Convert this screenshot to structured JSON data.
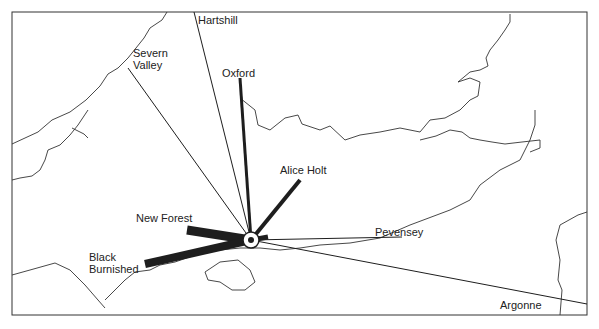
{
  "map": {
    "title": "Pottery sources supplying the site",
    "hub": {
      "x": 251,
      "y": 240,
      "label": "site"
    },
    "sources": [
      {
        "name": "Hartshill",
        "label_x": 198,
        "label_y": 14,
        "end_x": 194,
        "end_y": 12,
        "weight": 1
      },
      {
        "name": "Severn Valley",
        "label_x": 133,
        "label_y": 47,
        "end_x": 128,
        "end_y": 68,
        "weight": 1
      },
      {
        "name": "Oxford",
        "label_x": 222,
        "label_y": 67,
        "end_x": 240,
        "end_y": 78,
        "weight": 3
      },
      {
        "name": "Alice Holt",
        "label_x": 280,
        "label_y": 164,
        "end_x": 300,
        "end_y": 180,
        "weight": 4
      },
      {
        "name": "New Forest",
        "label_x": 136,
        "label_y": 212,
        "end_x": 187,
        "end_y": 230,
        "weight": 9
      },
      {
        "name": "Black Burnished",
        "label_x": 89,
        "label_y": 251,
        "end_x": 145,
        "end_y": 264,
        "weight": 8
      },
      {
        "name": "Pevensey",
        "label_x": 375,
        "label_y": 226,
        "end_x": 402,
        "end_y": 237,
        "weight": 1
      },
      {
        "name": "Argonne",
        "label_x": 500,
        "label_y": 299,
        "end_x": 587,
        "end_y": 304,
        "weight": 1
      }
    ],
    "colors": {
      "ink": "#1e1e1e",
      "background": "#ffffff"
    }
  }
}
